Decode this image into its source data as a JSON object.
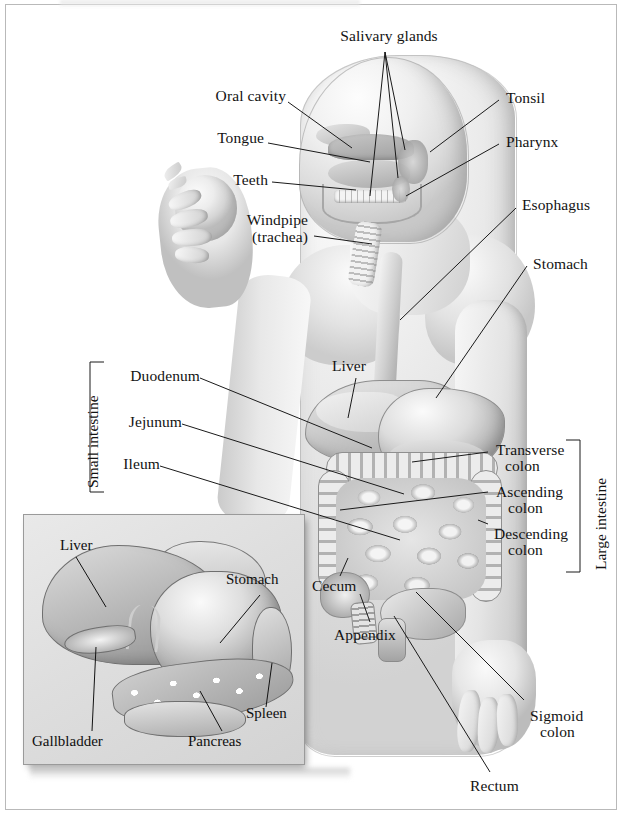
{
  "figure": {
    "title_partial": "",
    "style": "grayscale-anatomical-illustration"
  },
  "labels": {
    "salivary_glands": "Salivary glands",
    "oral_cavity": "Oral cavity",
    "tongue": "Tongue",
    "teeth": "Teeth",
    "windpipe_line1": "Windpipe",
    "windpipe_line2": "(trachea)",
    "tonsil": "Tonsil",
    "pharynx": "Pharynx",
    "esophagus": "Esophagus",
    "stomach": "Stomach",
    "liver": "Liver",
    "duodenum": "Duodenum",
    "jejunum": "Jejunum",
    "ileum": "Ileum",
    "transverse_line1": "Transverse",
    "transverse_line2": "colon",
    "ascending_line1": "Ascending",
    "ascending_line2": "colon",
    "descending_line1": "Descending",
    "descending_line2": "colon",
    "cecum": "Cecum",
    "appendix": "Appendix",
    "sigmoid_line1": "Sigmoid",
    "sigmoid_line2": "colon",
    "rectum": "Rectum"
  },
  "brackets": {
    "small_intestine": "Small intestine",
    "large_intestine": "Large intestine"
  },
  "inset": {
    "labels": {
      "liver": "Liver",
      "stomach": "Stomach",
      "gallbladder": "Gallbladder",
      "pancreas": "Pancreas",
      "spleen": "Spleen"
    }
  },
  "colors": {
    "ink": "#131313",
    "page_background": "#ffffff",
    "frame_border": "#b9b9b9",
    "inset_background": "#e0e0e0",
    "organ_mid_gray": "#b4b4b4",
    "organ_dark_gray": "#8f8f8f"
  }
}
